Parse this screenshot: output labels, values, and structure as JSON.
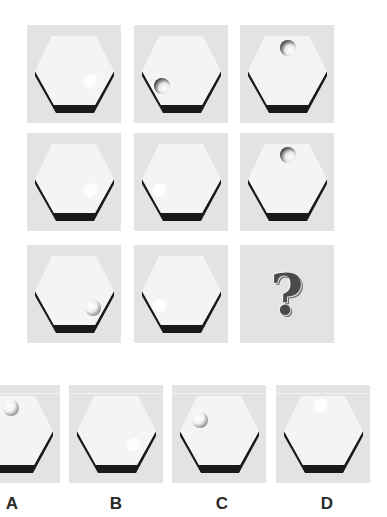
{
  "puzzle": {
    "colors": {
      "panel_bg": "#e3e3e3",
      "hex_face": "#f4f4f4",
      "hex_shadow": "#1a1a1a",
      "ball_shadow": "#9a9a9a"
    },
    "grid": [
      {
        "row": 1,
        "col": 1,
        "mark": "faint-ball",
        "position": "lower-right"
      },
      {
        "row": 1,
        "col": 2,
        "mark": "hole",
        "position": "lower-left"
      },
      {
        "row": 1,
        "col": 3,
        "mark": "hole",
        "position": "top"
      },
      {
        "row": 2,
        "col": 1,
        "mark": "faint-ball",
        "position": "lower-right"
      },
      {
        "row": 2,
        "col": 2,
        "mark": "faint-ball",
        "position": "lower-left"
      },
      {
        "row": 2,
        "col": 3,
        "mark": "hole",
        "position": "top"
      },
      {
        "row": 3,
        "col": 1,
        "mark": "ball",
        "position": "lower-right"
      },
      {
        "row": 3,
        "col": 2,
        "mark": "faint-ball",
        "position": "lower-left"
      },
      {
        "row": 3,
        "col": 3,
        "mark": "question",
        "symbol": "?"
      }
    ],
    "question_symbol": "?"
  },
  "options": [
    {
      "label": "A",
      "mark": "ball",
      "position": "top-left"
    },
    {
      "label": "B",
      "mark": "faint-ball",
      "position": "lower-right"
    },
    {
      "label": "C",
      "mark": "ball",
      "position": "upper-left"
    },
    {
      "label": "D",
      "mark": "faint-ball",
      "position": "top"
    }
  ]
}
